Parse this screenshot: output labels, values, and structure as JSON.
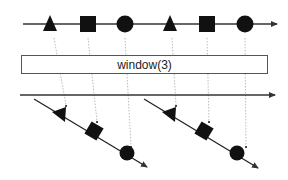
{
  "operator": {
    "label": "window(3)",
    "size": 3
  },
  "colors": {
    "line": "#333333",
    "shape": "#111111",
    "dotted": "#aaaaaa",
    "box_border": "#555555"
  },
  "source_stream": {
    "items": [
      {
        "shape": "triangle",
        "x": 50
      },
      {
        "shape": "square",
        "x": 88
      },
      {
        "shape": "circle",
        "x": 125
      },
      {
        "shape": "triangle",
        "x": 170
      },
      {
        "shape": "square",
        "x": 207
      },
      {
        "shape": "circle",
        "x": 245
      }
    ]
  },
  "output_stream": {
    "windows": [
      {
        "items": [
          {
            "shape": "triangle"
          },
          {
            "shape": "square"
          },
          {
            "shape": "circle"
          }
        ]
      },
      {
        "items": [
          {
            "shape": "triangle"
          },
          {
            "shape": "square"
          },
          {
            "shape": "circle"
          }
        ]
      }
    ]
  }
}
